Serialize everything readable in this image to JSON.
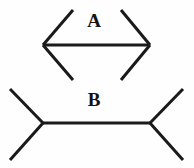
{
  "figure": {
    "background_color": "#fefefe",
    "line_color": "#1a1a1a",
    "stroke_width": 3,
    "canvas": {
      "width": 194,
      "height": 168
    },
    "labels": [
      {
        "id": "A",
        "text": "A",
        "x": 94,
        "y": 20
      },
      {
        "id": "B",
        "text": "B",
        "x": 94,
        "y": 99
      }
    ],
    "shapes": [
      {
        "name": "figure-a",
        "label": "A",
        "description": "horizontal shaft with outward-pointing arrowheads at both ends",
        "shaft": {
          "x1": 43,
          "y1": 45,
          "x2": 150,
          "y2": 45
        },
        "fins": [
          {
            "name": "a-fin-top-left",
            "x1": 43,
            "y1": 45,
            "x2": 73,
            "y2": 10
          },
          {
            "name": "a-fin-bottom-left",
            "x1": 43,
            "y1": 45,
            "x2": 73,
            "y2": 80
          },
          {
            "name": "a-fin-top-right",
            "x1": 150,
            "y1": 45,
            "x2": 121,
            "y2": 10
          },
          {
            "name": "a-fin-bottom-right",
            "x1": 150,
            "y1": 45,
            "x2": 121,
            "y2": 80
          }
        ]
      },
      {
        "name": "figure-b",
        "label": "B",
        "description": "horizontal shaft with inward-pointing (outward-spread) fins at both ends",
        "shaft": {
          "x1": 43,
          "y1": 123,
          "x2": 150,
          "y2": 123
        },
        "fins": [
          {
            "name": "b-fin-top-left",
            "x1": 43,
            "y1": 123,
            "x2": 10,
            "y2": 89
          },
          {
            "name": "b-fin-bottom-left",
            "x1": 43,
            "y1": 123,
            "x2": 10,
            "y2": 160
          },
          {
            "name": "b-fin-top-right",
            "x1": 150,
            "y1": 123,
            "x2": 183,
            "y2": 89
          },
          {
            "name": "b-fin-bottom-right",
            "x1": 150,
            "y1": 123,
            "x2": 183,
            "y2": 160
          }
        ]
      }
    ]
  }
}
